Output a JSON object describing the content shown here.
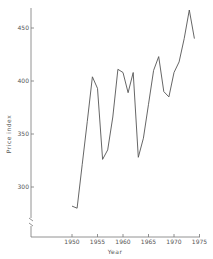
{
  "chart_data": {
    "type": "line",
    "title": "",
    "xlabel": "Year",
    "ylabel": "Price index",
    "x_ticks": [
      "1950",
      "1955",
      "1960",
      "1965",
      "1970",
      "1975"
    ],
    "y_ticks": [
      "300",
      "350",
      "400",
      "450"
    ],
    "xlim": [
      1944,
      1975
    ],
    "ylim": [
      250,
      470
    ],
    "grid": false,
    "legend": null,
    "y_axis_break": true,
    "x": [
      1950,
      1951,
      1952,
      1953,
      1954,
      1955,
      1956,
      1957,
      1958,
      1959,
      1960,
      1961,
      1962,
      1963,
      1964,
      1965,
      1966,
      1967,
      1968,
      1969,
      1970,
      1971,
      1972,
      1973,
      1974
    ],
    "series": [
      {
        "name": "Price index",
        "values": [
          282,
          280,
          321,
          362,
          404,
          393,
          326,
          335,
          366,
          411,
          408,
          389,
          408,
          328,
          346,
          378,
          410,
          423,
          390,
          385,
          408,
          418,
          440,
          467,
          440
        ]
      }
    ],
    "color": "#555555"
  }
}
